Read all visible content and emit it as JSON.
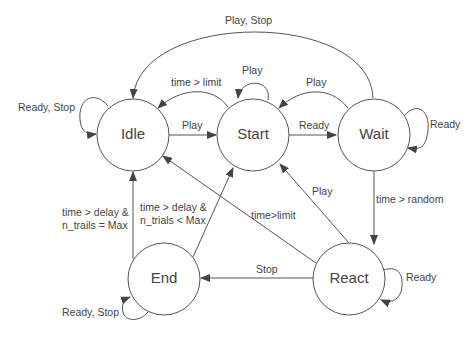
{
  "diagram": {
    "type": "state-machine",
    "states": [
      {
        "id": "idle",
        "label": "Idle"
      },
      {
        "id": "start",
        "label": "Start"
      },
      {
        "id": "wait",
        "label": "Wait"
      },
      {
        "id": "end",
        "label": "End"
      },
      {
        "id": "react",
        "label": "React"
      }
    ],
    "transitions": [
      {
        "from": "idle",
        "to": "idle",
        "label": "Ready, Stop"
      },
      {
        "from": "idle",
        "to": "start",
        "label": "Play"
      },
      {
        "from": "start",
        "to": "idle",
        "label": "time > limit"
      },
      {
        "from": "start",
        "to": "start",
        "label": "Play"
      },
      {
        "from": "start",
        "to": "wait",
        "label": "Ready"
      },
      {
        "from": "wait",
        "to": "start",
        "label": "Play"
      },
      {
        "from": "wait",
        "to": "wait",
        "label": "Ready"
      },
      {
        "from": "wait",
        "to": "idle",
        "label": "Play, Stop"
      },
      {
        "from": "wait",
        "to": "react",
        "label": "time > random"
      },
      {
        "from": "react",
        "to": "start",
        "label": "Play"
      },
      {
        "from": "react",
        "to": "idle",
        "label": "time>limit"
      },
      {
        "from": "react",
        "to": "end",
        "label": "Stop"
      },
      {
        "from": "react",
        "to": "react",
        "label": "Ready"
      },
      {
        "from": "end",
        "to": "idle",
        "label_line1": "time > delay &",
        "label_line2": "n_trails = Max"
      },
      {
        "from": "end",
        "to": "start",
        "label_line1": "time > delay &",
        "label_line2": "n_trials < Max"
      },
      {
        "from": "end",
        "to": "end",
        "label": "Ready, Stop"
      }
    ]
  }
}
